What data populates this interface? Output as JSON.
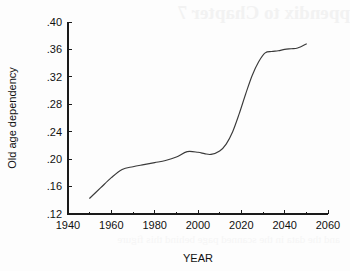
{
  "page": {
    "bleed_through_text": "ppendix to Chapter 7",
    "bleed_through_text_2": "and the data in the scanned page behind this figure"
  },
  "chart_data": {
    "type": "line",
    "title": "",
    "xlabel": "YEAR",
    "ylabel": "Old age dependency",
    "xlim": [
      1940,
      2060
    ],
    "ylim": [
      0.12,
      0.4
    ],
    "grid": false,
    "legend": false,
    "xticks": [
      1940,
      1960,
      1980,
      2000,
      2020,
      2040,
      2060
    ],
    "xtick_labels": [
      "1940",
      "1960",
      "1980",
      "2000",
      "2020",
      "2040",
      "2060"
    ],
    "yticks": [
      0.12,
      0.16,
      0.2,
      0.24,
      0.28,
      0.32,
      0.36,
      0.4
    ],
    "ytick_labels": [
      ".12",
      ".16",
      ".20",
      ".24",
      ".28",
      ".32",
      ".36",
      ".40"
    ],
    "series": [
      {
        "name": "Old age dependency",
        "color": "#3a3a3a",
        "x": [
          1950,
          1955,
          1960,
          1965,
          1970,
          1975,
          1980,
          1985,
          1990,
          1995,
          2000,
          2003,
          2006,
          2010,
          2013,
          2016,
          2019,
          2022,
          2025,
          2028,
          2031,
          2034,
          2037,
          2040,
          2043,
          2046,
          2050
        ],
        "y": [
          0.143,
          0.158,
          0.173,
          0.185,
          0.189,
          0.192,
          0.195,
          0.198,
          0.203,
          0.211,
          0.21,
          0.208,
          0.207,
          0.212,
          0.222,
          0.24,
          0.266,
          0.295,
          0.322,
          0.342,
          0.355,
          0.357,
          0.358,
          0.36,
          0.361,
          0.362,
          0.368
        ]
      }
    ]
  }
}
